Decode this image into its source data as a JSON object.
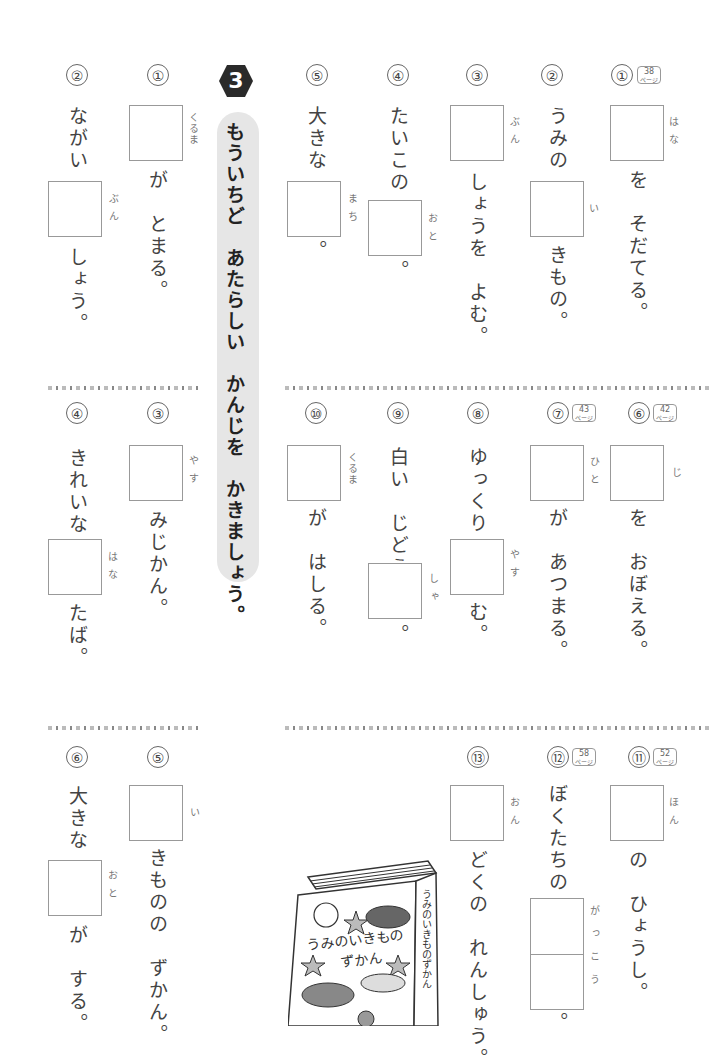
{
  "banner": {
    "badge": "3",
    "title": "もういちど　あたらしい　かんじを　かきましょう。"
  },
  "right_section": {
    "row1": [
      {
        "num": "①",
        "page_ref": "38",
        "page_unit": "ページ",
        "ruby": "はな",
        "parts": [
          "を　そだてる。"
        ]
      },
      {
        "num": "②",
        "before": "うみの",
        "ruby": "い",
        "after": "きもの。"
      },
      {
        "num": "③",
        "ruby": "ぶん",
        "after": "しょうを　よむ。"
      },
      {
        "num": "④",
        "before": "たいこの",
        "ruby": "おと",
        "after": "。"
      },
      {
        "num": "⑤",
        "before": "大きな",
        "ruby": "まち",
        "after": "。"
      }
    ],
    "row2": [
      {
        "num": "⑥",
        "page_ref": "42",
        "page_unit": "ページ",
        "ruby": "じ",
        "after": "を　おぼえる。"
      },
      {
        "num": "⑦",
        "page_ref": "43",
        "page_unit": "ページ",
        "ruby": "ひと",
        "after": "が　あつまる。"
      },
      {
        "num": "⑧",
        "before": "ゆっくり",
        "ruby": "やす",
        "after": "む。"
      },
      {
        "num": "⑨",
        "before": "白い　じどう",
        "ruby": "しゃ",
        "after": "。"
      },
      {
        "num": "⑩",
        "ruby": "くるま",
        "after": "が　はしる。"
      }
    ],
    "row3": [
      {
        "num": "⑪",
        "page_ref": "52",
        "page_unit": "ページ",
        "ruby": "ほん",
        "after": "の　ひょうし。"
      },
      {
        "num": "⑫",
        "page_ref": "58",
        "page_unit": "ページ",
        "before": "ぼくたちの",
        "ruby": "がっこう",
        "after": "。"
      },
      {
        "num": "⑬",
        "ruby": "おん",
        "after": "どくの　れんしゅう。"
      }
    ]
  },
  "left_section": {
    "row1": [
      {
        "num": "①",
        "ruby": "くるま",
        "after": "が　とまる。"
      },
      {
        "num": "②",
        "before": "ながい",
        "ruby": "ぶん",
        "after": "しょう。"
      }
    ],
    "row2": [
      {
        "num": "③",
        "ruby": "やす",
        "after": "みじかん。"
      },
      {
        "num": "④",
        "before": "きれいな",
        "ruby": "はな",
        "after": "たば。"
      }
    ],
    "row3": [
      {
        "num": "⑤",
        "ruby": "い",
        "after": "きものの　ずかん。"
      },
      {
        "num": "⑥",
        "before": "大きな",
        "ruby": "おと",
        "after": "が　する。"
      }
    ]
  },
  "illustration": {
    "cover_title_line1": "うみのいきもの",
    "cover_title_line2": "ずかん",
    "spine_text": "うみのいきものずかん"
  }
}
